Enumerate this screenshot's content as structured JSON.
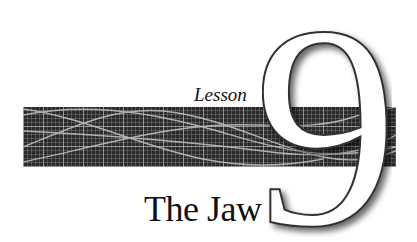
{
  "header": {
    "kicker": "Lesson",
    "number": "9",
    "title": "The Jaw"
  },
  "colors": {
    "banner_bg": "#2a2a2a",
    "grid": "#c8c8c8",
    "text": "#111111"
  }
}
